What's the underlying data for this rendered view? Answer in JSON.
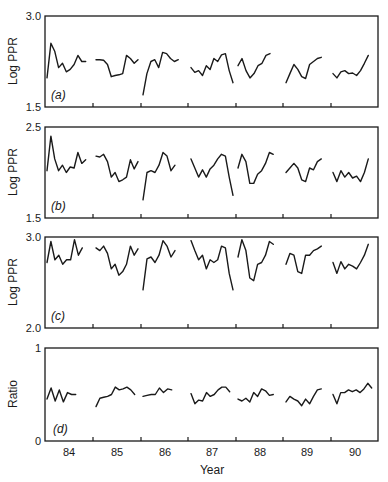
{
  "chart_data": [
    {
      "type": "line",
      "panel": "(a)",
      "ylabel": "Log PPR",
      "ylim": [
        1.5,
        3.0
      ],
      "yticks": [
        "3.0",
        "1.5"
      ],
      "xlabel": "",
      "categories": [
        "84",
        "85",
        "86",
        "87",
        "88",
        "89",
        "90"
      ],
      "series": [
        {
          "name": "Log PPR (a)",
          "segments": [
            [
              1.98,
              2.55,
              2.42,
              2.15,
              2.22,
              2.08,
              2.12,
              2.2,
              2.35,
              2.25,
              2.25
            ],
            [
              2.28,
              2.28,
              2.27,
              2.2,
              2.0,
              2.02,
              2.03,
              2.05,
              2.35,
              2.3,
              2.22,
              2.28
            ],
            [
              1.7,
              2.05,
              2.25,
              2.28,
              2.15,
              2.4,
              2.38,
              2.3,
              2.25,
              2.28
            ],
            [
              2.15,
              2.07,
              2.1,
              2.02,
              2.18,
              2.12,
              2.3,
              2.25,
              2.36,
              2.38,
              2.1,
              1.9
            ],
            [
              2.18,
              2.3,
              2.1,
              1.98,
              2.05,
              2.18,
              2.22,
              2.35,
              2.38
            ],
            [
              1.9,
              2.05,
              2.2,
              2.12,
              2.0,
              1.97,
              2.2,
              2.25,
              2.3,
              2.32
            ],
            [
              2.05,
              1.98,
              2.08,
              2.1,
              2.05,
              2.06,
              2.02,
              2.1,
              2.22,
              2.35
            ]
          ]
        }
      ]
    },
    {
      "type": "line",
      "panel": "(b)",
      "ylabel": "Log PPR",
      "ylim": [
        1.5,
        2.5
      ],
      "yticks": [
        "2.5",
        "1.5"
      ],
      "xlabel": "",
      "categories": [
        "84",
        "85",
        "86",
        "87",
        "88",
        "89",
        "90"
      ],
      "series": [
        {
          "name": "Log PPR (b)",
          "segments": [
            [
              2.02,
              2.4,
              2.15,
              2.02,
              2.08,
              2.0,
              2.06,
              2.05,
              2.22,
              2.1,
              2.14
            ],
            [
              2.18,
              2.17,
              2.2,
              2.12,
              1.95,
              2.0,
              1.9,
              1.92,
              1.95,
              2.14,
              2.04,
              2.12
            ],
            [
              1.7,
              2.0,
              2.02,
              2.0,
              2.08,
              2.22,
              2.18,
              2.02,
              2.08
            ],
            [
              2.15,
              2.05,
              1.95,
              2.03,
              1.95,
              2.04,
              2.08,
              2.15,
              2.2,
              2.18,
              1.95,
              1.75
            ],
            [
              2.05,
              2.2,
              2.12,
              1.88,
              1.88,
              1.98,
              2.02,
              2.1,
              2.22,
              2.2
            ],
            [
              2.0,
              2.05,
              2.1,
              2.05,
              1.92,
              1.9,
              2.05,
              2.03,
              2.12,
              2.15
            ],
            [
              2.0,
              1.9,
              2.02,
              1.95,
              2.0,
              1.94,
              1.96,
              1.9,
              2.0,
              2.15
            ]
          ]
        }
      ]
    },
    {
      "type": "line",
      "panel": "(c)",
      "ylabel": "Log PPR",
      "ylim": [
        2.0,
        3.0
      ],
      "yticks": [
        "3.0",
        "2.0"
      ],
      "xlabel": "",
      "categories": [
        "84",
        "85",
        "86",
        "87",
        "88",
        "89",
        "90"
      ],
      "series": [
        {
          "name": "Log PPR (c)",
          "segments": [
            [
              2.72,
              2.95,
              2.75,
              2.8,
              2.7,
              2.75,
              2.75,
              2.97,
              2.8,
              2.88
            ],
            [
              2.88,
              2.85,
              2.9,
              2.82,
              2.65,
              2.7,
              2.58,
              2.62,
              2.7,
              2.9,
              2.8,
              2.87
            ],
            [
              2.42,
              2.76,
              2.78,
              2.72,
              2.8,
              2.96,
              2.9,
              2.78,
              2.85
            ],
            [
              2.96,
              2.85,
              2.75,
              2.8,
              2.65,
              2.75,
              2.72,
              2.75,
              2.9,
              2.88,
              2.6,
              2.42
            ],
            [
              2.78,
              2.97,
              2.85,
              2.55,
              2.52,
              2.7,
              2.72,
              2.8,
              2.95,
              2.92
            ],
            [
              2.7,
              2.82,
              2.8,
              2.62,
              2.6,
              2.8,
              2.8,
              2.85,
              2.87,
              2.9
            ],
            [
              2.72,
              2.6,
              2.73,
              2.65,
              2.7,
              2.68,
              2.65,
              2.72,
              2.8,
              2.92
            ]
          ]
        }
      ]
    },
    {
      "type": "line",
      "panel": "(d)",
      "ylabel": "Ratio",
      "xlabel": "Year",
      "ylim": [
        0,
        1
      ],
      "yticks": [
        "1",
        "0"
      ],
      "categories": [
        "84",
        "85",
        "86",
        "87",
        "88",
        "89",
        "90"
      ],
      "series": [
        {
          "name": "Ratio (d)",
          "segments": [
            [
              0.45,
              0.57,
              0.43,
              0.55,
              0.42,
              0.52,
              0.5,
              0.5
            ],
            [
              0.37,
              0.46,
              0.47,
              0.48,
              0.5,
              0.58,
              0.55,
              0.56,
              0.58,
              0.55,
              0.5
            ],
            [
              0.48,
              0.49,
              0.5,
              0.5,
              0.57,
              0.52,
              0.56,
              0.55
            ],
            [
              0.51,
              0.4,
              0.44,
              0.43,
              0.52,
              0.48,
              0.5,
              0.55,
              0.58,
              0.58,
              0.53
            ],
            [
              0.45,
              0.43,
              0.46,
              0.42,
              0.52,
              0.48,
              0.56,
              0.54,
              0.49,
              0.5
            ],
            [
              0.42,
              0.48,
              0.45,
              0.43,
              0.38,
              0.45,
              0.4,
              0.48,
              0.55,
              0.56
            ],
            [
              0.5,
              0.4,
              0.52,
              0.52,
              0.55,
              0.53,
              0.55,
              0.52,
              0.56,
              0.62,
              0.57
            ]
          ]
        }
      ]
    }
  ],
  "labels": {
    "panel_a": "(a)",
    "panel_b": "(b)",
    "panel_c": "(c)",
    "panel_d": "(d)",
    "ylabel_a": "Log PPR",
    "ylabel_b": "Log PPR",
    "ylabel_c": "Log PPR",
    "ylabel_d": "Ratio",
    "xlabel": "Year",
    "a_top": "3.0",
    "a_bottom": "1.5",
    "b_top": "2.5",
    "b_bottom": "1.5",
    "c_top": "3.0",
    "c_bottom": "2.0",
    "d_top": "1",
    "d_bottom": "0",
    "years": [
      "84",
      "85",
      "86",
      "87",
      "88",
      "89",
      "90"
    ]
  }
}
